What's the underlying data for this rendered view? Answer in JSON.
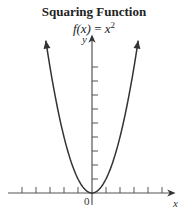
{
  "title": "Squaring Function",
  "formula": {
    "lhs": "f(x)",
    "eq": " = ",
    "base": "x",
    "exp": "2"
  },
  "axes": {
    "x_label": "x",
    "y_label": "y",
    "origin_label": "0"
  },
  "chart_data": {
    "type": "line",
    "title": "Squaring Function",
    "subtitle": "f(x) = x^2",
    "xlabel": "x",
    "ylabel": "y",
    "series": [
      {
        "name": "f(x) = x^2",
        "x": [
          -3.3,
          -3,
          -2,
          -1,
          0,
          1,
          2,
          3,
          3.3
        ],
        "values": [
          10.9,
          9,
          4,
          1,
          0,
          1,
          4,
          9,
          10.9
        ]
      }
    ],
    "x_ticks": [
      -5,
      -4,
      -3,
      -2,
      -1,
      1,
      2,
      3,
      4,
      5
    ],
    "y_ticks": [
      1,
      2,
      3,
      4,
      5,
      6,
      7,
      8,
      9
    ],
    "tick_labels_shown": [
      "0"
    ],
    "xlim": [
      -6,
      6
    ],
    "ylim": [
      0,
      11
    ],
    "grid": false,
    "legend": null,
    "arrows_on_curve_ends": true
  }
}
